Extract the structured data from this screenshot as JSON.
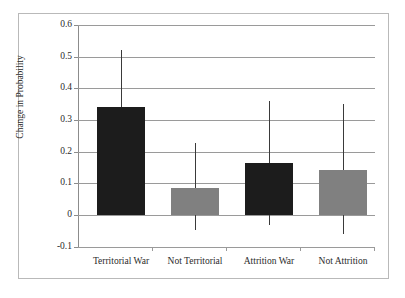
{
  "chart_data": {
    "type": "bar",
    "title": "",
    "xlabel": "",
    "ylabel": "Change in Probability",
    "categories": [
      "Territorial War",
      "Not Territorial",
      "Attrition War",
      "Not Attrition"
    ],
    "values": [
      0.34,
      0.085,
      0.165,
      0.143
    ],
    "error_low": [
      0.34,
      -0.047,
      -0.032,
      -0.06
    ],
    "error_high": [
      0.52,
      0.228,
      0.36,
      0.35
    ],
    "bar_colors": [
      "#1c1c1c",
      "#808080",
      "#1c1c1c",
      "#808080"
    ],
    "ylim": [
      -0.1,
      0.6
    ],
    "ytick_labels": [
      "0.6",
      "0.5",
      "0.4",
      "0.3",
      "0.2",
      "0.1",
      "0",
      "-0.1"
    ],
    "ytick_values": [
      0.6,
      0.5,
      0.4,
      0.3,
      0.2,
      0.1,
      0,
      -0.1
    ],
    "grid": true,
    "legend": "none"
  },
  "axes": {
    "y_title": "Change in Probability"
  },
  "colors": {
    "bar_dark": "#1c1c1c",
    "bar_light": "#808080",
    "gridline": "#9a9a9a",
    "frame": "#b9b9b9",
    "errorbar": "#3a3a3a",
    "text": "#2b2b2b"
  }
}
